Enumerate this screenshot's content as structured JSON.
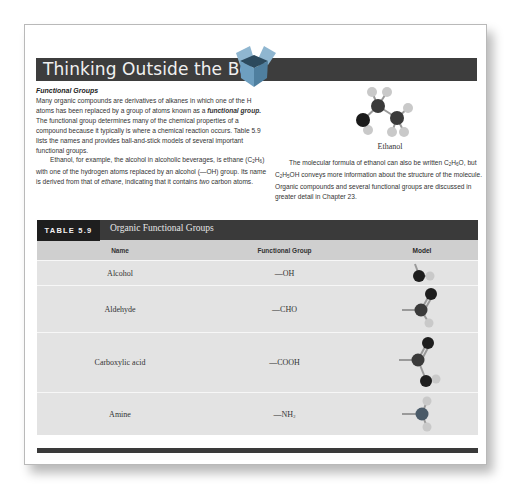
{
  "feature": {
    "title": "Thinking Outside the Box",
    "heading": "Functional Groups",
    "para1": {
      "a": "Many organic compounds are derivatives of alkanes in which one of the H atoms has been replaced by a group of atoms known as a ",
      "term": "functional group.",
      "b": " The functional group determines many of the chemical properties of a compound because it typically is where a chemical reaction occurs. Table 5.9 lists the names and provides ball-and-stick models of several important functional groups."
    },
    "para2": {
      "a": "Ethanol, for example, the alcohol in alcoholic beverages, is ethane (C",
      "sub1": "2",
      "b": "H",
      "sub2": "6",
      "c": ") with one of the hydrogen atoms replaced by an alcohol (—OH) group. Its name is derived from that of ",
      "ethane": "ethane",
      "d": ", indicating that it contains ",
      "two": "two",
      "e": " carbon atoms."
    },
    "molecule_caption": "Ethanol",
    "para3": {
      "a": "The molecular formula of ethanol can also be written C",
      "s1": "2",
      "b": "H",
      "s2": "6",
      "c": "O, but C",
      "s3": "2",
      "d": "H",
      "s4": "5",
      "e": "OH conveys more information about the structure of the molecule. Organic compounds and several functional groups are discussed in greater detail in Chapter 23."
    }
  },
  "table": {
    "label": "TABLE 5.9",
    "caption": "Organic Functional Groups",
    "columns": [
      "Name",
      "Functional Group",
      "Model"
    ],
    "rows": [
      {
        "name": "Alcohol",
        "group": "—OH",
        "model": "alcohol-model"
      },
      {
        "name": "Aldehyde",
        "group": "—CHO",
        "model": "aldehyde-model"
      },
      {
        "name": "Carboxylic acid",
        "group": "—COOH",
        "model": "carboxylic-acid-model"
      },
      {
        "name": "Amine",
        "group": "—NH",
        "group_sub": "2",
        "model": "amine-model"
      }
    ]
  },
  "colors": {
    "band": "#3d3d3d",
    "table_label": "#1e1e1e",
    "header_row": "#cfcfcf",
    "row_bg": "#e3e3e3",
    "box_icon": "#6e9fc0"
  }
}
